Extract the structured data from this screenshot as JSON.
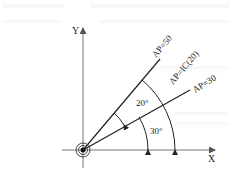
{
  "diagram": {
    "axes": {
      "x_label": "X",
      "y_label": "Y"
    },
    "origin_symbol": "concentric-circle-origin",
    "rays": [
      {
        "label": "AP=50",
        "angle_deg": 50
      },
      {
        "label": "AP=IC(20)",
        "angle_deg": 50,
        "note": "incremental 20° from 30°"
      },
      {
        "label": "AP=30",
        "angle_deg": 30
      }
    ],
    "angle_annotations": [
      {
        "label": "20°",
        "from_deg": 30,
        "to_deg": 50
      },
      {
        "label": "30°",
        "from_deg": 0,
        "to_deg": 30
      }
    ],
    "colors": {
      "line": "#222222",
      "axis": "#666666"
    }
  }
}
